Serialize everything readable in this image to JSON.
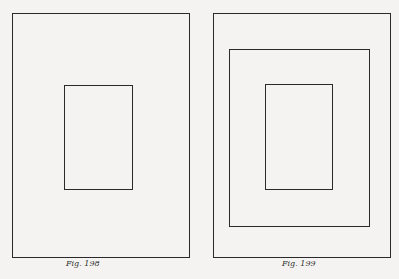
{
  "figures": [
    {
      "caption": "Fig. 198",
      "rects": [
        {
          "role": "outer",
          "x": 12,
          "y": 13,
          "w": 178,
          "h": 245
        },
        {
          "role": "inner",
          "x": 64,
          "y": 85,
          "w": 69,
          "h": 105
        }
      ]
    },
    {
      "caption": "Fig. 199",
      "rects": [
        {
          "role": "outer",
          "x": 213,
          "y": 13,
          "w": 178,
          "h": 245
        },
        {
          "role": "middle",
          "x": 229,
          "y": 49,
          "w": 141,
          "h": 178
        },
        {
          "role": "inner",
          "x": 265,
          "y": 84,
          "w": 68,
          "h": 106
        }
      ]
    }
  ],
  "colors": {
    "background": "#f4f3f1",
    "line": "#2a2a2a"
  }
}
